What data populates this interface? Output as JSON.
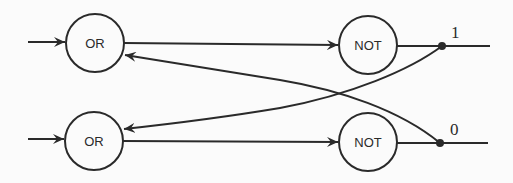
{
  "diagram": {
    "title": "",
    "colors": {
      "stroke": "#2a2a2a",
      "background": "#fbfbfb"
    },
    "gates": [
      {
        "id": "or_top",
        "label": "OR",
        "cx": 95,
        "cy": 43,
        "r": 29
      },
      {
        "id": "not_top",
        "label": "NOT",
        "cx": 368,
        "cy": 45,
        "r": 29
      },
      {
        "id": "or_bottom",
        "label": "OR",
        "cx": 94,
        "cy": 141,
        "r": 29
      },
      {
        "id": "not_bottom",
        "label": "NOT",
        "cx": 368,
        "cy": 142,
        "r": 29
      }
    ],
    "outputs": [
      {
        "id": "out_top",
        "label": "1",
        "x": 442,
        "y": 46
      },
      {
        "id": "out_bottom",
        "label": "0",
        "x": 440,
        "y": 143
      }
    ],
    "connections": [
      {
        "from": "input_top",
        "to": "or_top"
      },
      {
        "from": "input_bottom",
        "to": "or_bottom"
      },
      {
        "from": "or_top",
        "to": "not_top"
      },
      {
        "from": "or_bottom",
        "to": "not_bottom"
      },
      {
        "from": "not_top",
        "to": "out_top"
      },
      {
        "from": "not_bottom",
        "to": "out_bottom"
      },
      {
        "from": "out_top",
        "to": "or_bottom",
        "type": "feedback"
      },
      {
        "from": "out_bottom",
        "to": "or_top",
        "type": "feedback"
      }
    ]
  }
}
